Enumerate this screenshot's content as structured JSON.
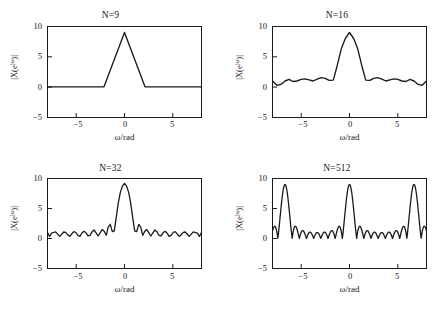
{
  "figure": {
    "header_remnant": "",
    "panels": [
      {
        "title": "N=9",
        "ylabel_main": "|X(e",
        "ylabel_sup": "jω",
        "ylabel_tail": ")|",
        "xlabel": "ω/rad"
      },
      {
        "title": "N=16",
        "ylabel_main": "|X(e",
        "ylabel_sup": "jω",
        "ylabel_tail": ")|",
        "xlabel": "ω/rad"
      },
      {
        "title": "N=32",
        "ylabel_main": "|X(e",
        "ylabel_sup": "jω",
        "ylabel_tail": ")|",
        "xlabel": "ω/rad"
      },
      {
        "title": "N=512",
        "ylabel_main": "|X(e",
        "ylabel_sup": "jω",
        "ylabel_tail": ")|",
        "xlabel": "ω/rad"
      }
    ]
  },
  "chart_data": [
    {
      "type": "line",
      "title": "N=9",
      "xlabel": "ω/rad",
      "ylabel": "|X(e^{jω})|",
      "xlim": [
        -7.5,
        7.5
      ],
      "ylim": [
        -5,
        10
      ],
      "xticks": [
        -5,
        0,
        5
      ],
      "yticks": [
        -5,
        0,
        5,
        10
      ],
      "grid": false,
      "legend": "none",
      "series": [
        {
          "name": "|X(e^{jω})| N=9",
          "x": [
            -7.5,
            -6.98,
            -6.28,
            -5.59,
            -4.89,
            -4.19,
            -3.49,
            -2.79,
            -2.09,
            -1.4,
            -0.7,
            0.0,
            0.7,
            1.4,
            2.09,
            2.79,
            3.49,
            4.19,
            4.89,
            5.59,
            6.28,
            6.98,
            7.5
          ],
          "y": [
            0.05,
            0.05,
            0.05,
            0.05,
            0.05,
            0.05,
            0.05,
            0.05,
            0.05,
            3.1,
            6.05,
            9.0,
            6.05,
            3.1,
            0.05,
            0.05,
            0.05,
            0.05,
            0.05,
            0.05,
            0.05,
            0.05,
            0.05
          ]
        }
      ]
    },
    {
      "type": "line",
      "title": "N=16",
      "xlabel": "ω/rad",
      "ylabel": "|X(e^{jω})|",
      "xlim": [
        -7.5,
        7.5
      ],
      "ylim": [
        -5,
        10
      ],
      "xticks": [
        -5,
        0,
        5
      ],
      "yticks": [
        -5,
        0,
        5,
        10
      ],
      "grid": false,
      "legend": "none",
      "series": [
        {
          "name": "|X(e^{jω})| N=16",
          "x": [
            -7.5,
            -7.07,
            -6.68,
            -6.28,
            -5.89,
            -5.5,
            -5.11,
            -4.71,
            -4.32,
            -3.93,
            -3.53,
            -3.14,
            -2.75,
            -2.36,
            -1.96,
            -1.57,
            -1.18,
            -0.79,
            -0.39,
            0.0,
            0.39,
            0.79,
            1.18,
            1.57,
            1.96,
            2.36,
            2.75,
            3.14,
            3.53,
            3.93,
            4.32,
            4.71,
            5.11,
            5.5,
            5.89,
            6.28,
            6.68,
            7.07,
            7.5
          ],
          "y": [
            1.0,
            0.3,
            0.45,
            1.0,
            1.25,
            0.9,
            1.0,
            1.25,
            1.35,
            1.2,
            1.0,
            1.3,
            1.55,
            1.45,
            1.1,
            1.15,
            3.6,
            6.3,
            8.0,
            9.0,
            8.0,
            6.3,
            3.6,
            1.15,
            1.1,
            1.45,
            1.55,
            1.3,
            1.0,
            1.2,
            1.35,
            1.25,
            1.0,
            0.9,
            1.25,
            1.0,
            0.45,
            0.3,
            1.0
          ]
        }
      ]
    },
    {
      "type": "line",
      "title": "N=32",
      "xlabel": "ω/rad",
      "ylabel": "|X(e^{jω})|",
      "xlim": [
        -7.5,
        7.5
      ],
      "ylim": [
        -5,
        10
      ],
      "xticks": [
        -5,
        0,
        5
      ],
      "yticks": [
        -5,
        0,
        5,
        10
      ],
      "grid": false,
      "legend": "none",
      "series": [
        {
          "name": "|X(e^{jω})| N=32",
          "x": [
            -7.5,
            -7.07,
            -6.87,
            -6.68,
            -6.48,
            -6.28,
            -6.09,
            -5.89,
            -5.7,
            -5.5,
            -5.3,
            -5.11,
            -4.91,
            -4.71,
            -4.52,
            -4.32,
            -4.12,
            -3.93,
            -3.73,
            -3.53,
            -3.34,
            -3.14,
            -2.95,
            -2.75,
            -2.55,
            -2.36,
            -2.16,
            -1.96,
            -1.77,
            -1.57,
            -1.37,
            -1.18,
            -0.98,
            -0.79,
            -0.59,
            -0.39,
            -0.2,
            0.0,
            0.2,
            0.39,
            0.59,
            0.79,
            0.98,
            1.18,
            1.37,
            1.57,
            1.77,
            1.96,
            2.16,
            2.36,
            2.55,
            2.75,
            2.95,
            3.14,
            3.34,
            3.53,
            3.73,
            3.93,
            4.12,
            4.32,
            4.52,
            4.71,
            4.91,
            5.11,
            5.3,
            5.5,
            5.7,
            5.89,
            6.09,
            6.28,
            6.48,
            6.68,
            6.87,
            7.07,
            7.5
          ],
          "y": [
            1.0,
            0.35,
            0.55,
            1.0,
            1.1,
            0.75,
            0.35,
            0.7,
            1.1,
            1.05,
            0.6,
            0.35,
            0.8,
            1.15,
            1.0,
            0.5,
            0.4,
            0.95,
            1.2,
            0.95,
            0.45,
            0.6,
            1.25,
            1.5,
            1.15,
            0.7,
            1.05,
            1.9,
            2.1,
            1.15,
            1.2,
            2.6,
            4.4,
            6.3,
            7.9,
            8.8,
            9.05,
            9.1,
            9.05,
            8.8,
            7.9,
            6.3,
            4.4,
            2.6,
            1.2,
            1.15,
            2.1,
            1.9,
            1.05,
            0.7,
            1.15,
            1.5,
            1.25,
            0.6,
            0.45,
            0.95,
            1.2,
            0.95,
            0.4,
            0.5,
            1.0,
            1.15,
            0.8,
            0.35,
            0.6,
            1.05,
            1.1,
            0.7,
            0.35,
            0.75,
            1.1,
            1.0,
            0.55,
            0.35,
            1.0
          ]
        }
      ]
    },
    {
      "type": "line",
      "title": "N=512",
      "xlabel": "ω/rad",
      "ylabel": "|X(e^{jω})|",
      "xlim": [
        -7.5,
        7.5
      ],
      "ylim": [
        -5,
        10
      ],
      "xticks": [
        -5,
        0,
        5
      ],
      "yticks": [
        -5,
        0,
        5,
        10
      ],
      "grid": false,
      "legend": "none",
      "description": "Dirichlet kernel |sin(4.5ω)/sin(0.5ω)|, main lobe peak 9 at ω=0, sidelobe peaks near 1.0-1.1, nulls near 0",
      "series": [
        {
          "name": "|X(e^{jω})| N=512",
          "formula": "abs(sin(4.5*w)/sin(0.5*w))",
          "peak_value": 9,
          "peak_x": 0,
          "sidelobe_peak": 1.05,
          "null_spacing": 1.396
        }
      ]
    }
  ]
}
